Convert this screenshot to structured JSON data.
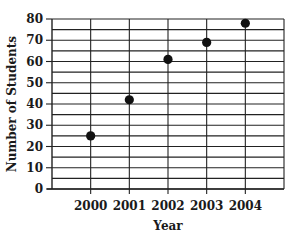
{
  "chart_data": {
    "type": "scatter",
    "title": "",
    "xlabel": "Year",
    "ylabel": "Number of Students",
    "categories": [
      "2000",
      "2001",
      "2002",
      "2003",
      "2004"
    ],
    "values": [
      25,
      42,
      61,
      69,
      78
    ],
    "ylim": [
      0,
      80
    ],
    "yticks": [
      0,
      10,
      20,
      30,
      40,
      50,
      60,
      70,
      80
    ],
    "minor_gridline_step": 5,
    "grid": true,
    "legend": null,
    "marker_color": "#111111",
    "grid_color": "#222222"
  }
}
